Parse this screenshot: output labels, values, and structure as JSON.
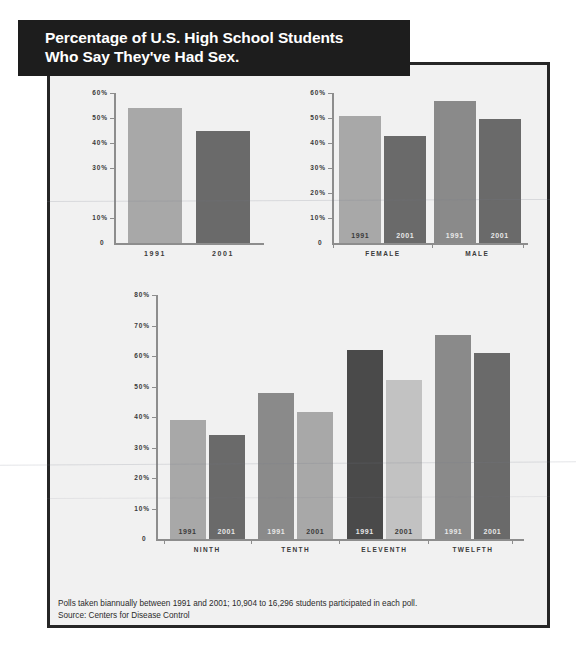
{
  "banner": {
    "line1": "Percentage of U.S. High School Students",
    "line2": "Who Say They've Had Sex."
  },
  "footnote": {
    "line1": "Polls taken biannually between 1991 and 2001; 10,904 to 16,296 students participated in each poll.",
    "line2": "Source: Centers for Disease Control"
  },
  "colors": {
    "banner_bg": "#1d1d1d",
    "panel_bg": "#f1f1f1",
    "frame": "#262626",
    "axis": "#8d8d8d",
    "bar_light": "#a8a8a8",
    "bar_mid": "#8a8a8a",
    "bar_dark": "#6a6a6a",
    "bar_vdark": "#4a4a4a",
    "bar_pale": "#c2c2c2"
  },
  "chart_data": [
    {
      "type": "bar",
      "id": "overall",
      "title": "",
      "xlabel": "",
      "ylabel": "",
      "ylim": [
        0,
        60
      ],
      "ytick_labels": [
        "60%",
        "50%",
        "40%",
        "30%",
        "10%"
      ],
      "yticks": [
        60,
        50,
        40,
        30,
        10
      ],
      "zero_label": "0",
      "grid": false,
      "categories": [
        "1991",
        "2001"
      ],
      "values": [
        54,
        45
      ],
      "bar_styles": [
        "bar-light",
        "bar-dark"
      ],
      "label_position": "below-axis"
    },
    {
      "type": "bar",
      "id": "by-gender",
      "title": "",
      "xlabel": "",
      "ylabel": "",
      "ylim": [
        0,
        60
      ],
      "ytick_labels": [
        "60%",
        "50%",
        "40%",
        "30%",
        "20%",
        "10%"
      ],
      "yticks": [
        60,
        50,
        40,
        30,
        20,
        10
      ],
      "zero_label": "0",
      "grid": false,
      "groups": [
        "FEMALE",
        "MALE"
      ],
      "categories": [
        "1991",
        "2001"
      ],
      "series": [
        {
          "name": "1991",
          "values": [
            51,
            57
          ]
        },
        {
          "name": "2001",
          "values": [
            43,
            49.5
          ]
        }
      ],
      "bars": [
        {
          "group": "FEMALE",
          "year": "1991",
          "value": 51,
          "style": "bar-light",
          "label_color": "onlight"
        },
        {
          "group": "FEMALE",
          "year": "2001",
          "value": 43,
          "style": "bar-dark",
          "label_color": "ondark"
        },
        {
          "group": "MALE",
          "year": "1991",
          "value": 57,
          "style": "bar-mid",
          "label_color": "ondark"
        },
        {
          "group": "MALE",
          "year": "2001",
          "value": 49.5,
          "style": "bar-dark",
          "label_color": "ondark"
        }
      ],
      "label_position": "in-bar"
    },
    {
      "type": "bar",
      "id": "by-grade",
      "title": "",
      "xlabel": "",
      "ylabel": "",
      "ylim": [
        0,
        80
      ],
      "ytick_labels": [
        "80%",
        "70%",
        "60%",
        "50%",
        "40%",
        "30%",
        "20%",
        "10%"
      ],
      "yticks": [
        80,
        70,
        60,
        50,
        40,
        30,
        20,
        10
      ],
      "zero_label": "0",
      "grid": false,
      "groups": [
        "NINTH",
        "TENTH",
        "ELEVENTH",
        "TWELFTH"
      ],
      "categories": [
        "1991",
        "2001"
      ],
      "series": [
        {
          "name": "1991",
          "values": [
            39,
            48,
            62,
            67
          ]
        },
        {
          "name": "2001",
          "values": [
            34,
            41.5,
            52,
            61
          ]
        }
      ],
      "bars": [
        {
          "group": "NINTH",
          "year": "1991",
          "value": 39,
          "style": "bar-light",
          "label_color": "onlight"
        },
        {
          "group": "NINTH",
          "year": "2001",
          "value": 34,
          "style": "bar-dark",
          "label_color": "ondark"
        },
        {
          "group": "TENTH",
          "year": "1991",
          "value": 48,
          "style": "bar-mid",
          "label_color": "ondark"
        },
        {
          "group": "TENTH",
          "year": "2001",
          "value": 41.5,
          "style": "bar-light",
          "label_color": "onlight"
        },
        {
          "group": "ELEVENTH",
          "year": "1991",
          "value": 62,
          "style": "bar-vdark",
          "label_color": "ondark"
        },
        {
          "group": "ELEVENTH",
          "year": "2001",
          "value": 52,
          "style": "bar-pale",
          "label_color": "onlight"
        },
        {
          "group": "TWELFTH",
          "year": "1991",
          "value": 67,
          "style": "bar-mid",
          "label_color": "ondark"
        },
        {
          "group": "TWELFTH",
          "year": "2001",
          "value": 61,
          "style": "bar-dark",
          "label_color": "ondark"
        }
      ],
      "label_position": "in-bar"
    }
  ]
}
